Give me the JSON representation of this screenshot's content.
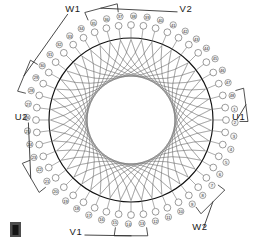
{
  "diagram": {
    "type": "stator-winding-schematic",
    "slot_count": 48,
    "phases": 3,
    "colors": {
      "bore_stroke": "#111111",
      "winding_stroke": "#6d6d6d",
      "slot_stroke": "#4a4a4a",
      "lead_stroke": "#262626",
      "background": "#ffffff",
      "text": "#1a1a1a"
    },
    "geometry": {
      "center_x": 131,
      "center_y": 120,
      "bore_radius": 82,
      "slot_ring_radius": 95,
      "number_ring_radius": 104,
      "inner_void_radius": 36,
      "slot_circle_radius": 3.4,
      "number_circle_radius": 3.2,
      "start_angle_deg": -7.5,
      "winding_span_slots": 11,
      "winding_inner_scale": 0.44
    }
  },
  "terminals": [
    {
      "id": "U1",
      "label": "U1",
      "slot": 1,
      "side": "right",
      "text_x": 232,
      "text_y": 120,
      "anchor": "start"
    },
    {
      "id": "U2",
      "label": "U2",
      "slot": 22,
      "side": "left",
      "text_x": 28,
      "text_y": 120,
      "anchor": "end"
    },
    {
      "id": "V1",
      "label": "V1",
      "slot": 14,
      "side": "bottom-left",
      "text_x": 76,
      "text_y": 235,
      "anchor": "middle"
    },
    {
      "id": "V2",
      "label": "V2",
      "slot": 36,
      "side": "top-right",
      "text_x": 186,
      "text_y": 12,
      "anchor": "middle"
    },
    {
      "id": "W1",
      "label": "W1",
      "slot": 29,
      "side": "top-left",
      "text_x": 73,
      "text_y": 12,
      "anchor": "middle"
    },
    {
      "id": "W2",
      "label": "W2",
      "slot": 8,
      "side": "bottom-right",
      "text_x": 200,
      "text_y": 230,
      "anchor": "middle"
    }
  ],
  "slot_numbers": [
    "1",
    "2",
    "3",
    "4",
    "5",
    "6",
    "7",
    "8",
    "9",
    "10",
    "11",
    "12",
    "13",
    "14",
    "15",
    "16",
    "17",
    "18",
    "19",
    "20",
    "21",
    "22",
    "23",
    "24",
    "25",
    "26",
    "27",
    "28",
    "29",
    "30",
    "31",
    "32",
    "33",
    "34",
    "35",
    "36",
    "37",
    "38",
    "39",
    "40",
    "41",
    "42",
    "43",
    "44",
    "45",
    "46",
    "47",
    "48"
  ],
  "corner_mark": {
    "name": "page-corner-marker",
    "x": 10,
    "y": 222,
    "width": 11,
    "height": 15
  }
}
